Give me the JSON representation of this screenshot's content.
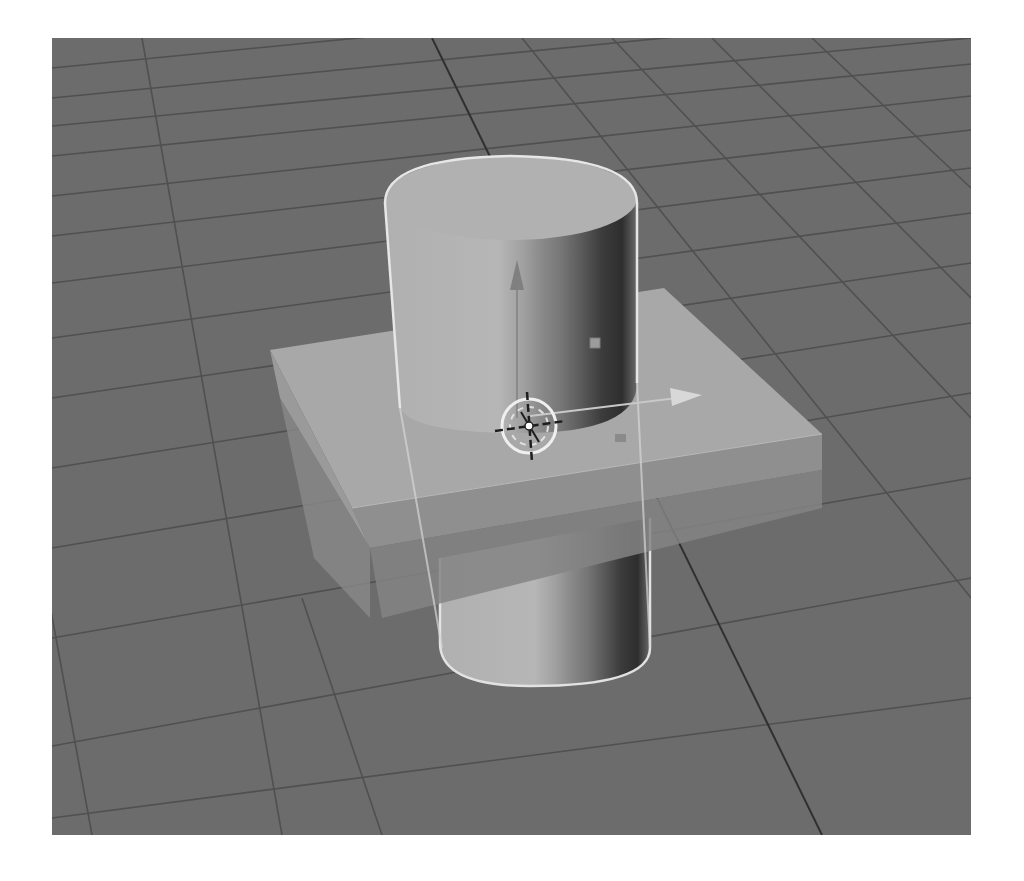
{
  "viewport": {
    "type": "3d-viewport",
    "shading": "solid",
    "colors": {
      "background": "#6c6c6c",
      "grid_line": "#4e4e4e",
      "axis_line": "#2e2e2e",
      "box_top": "#a9a9a9",
      "box_front": "#8e8e8e",
      "box_side": "#9a9a9a",
      "cylinder_light": "#b4b4b4",
      "cylinder_dark": "#3a3a3a",
      "selection_outline": "#e6e6e6"
    },
    "objects": [
      {
        "name": "cylinder",
        "selected": true
      },
      {
        "name": "box",
        "selected": false
      }
    ],
    "gizmo": {
      "axes": [
        "z-arrow",
        "x-arrow"
      ]
    },
    "cursor_3d": {
      "icon": "3d-cursor-icon"
    }
  }
}
